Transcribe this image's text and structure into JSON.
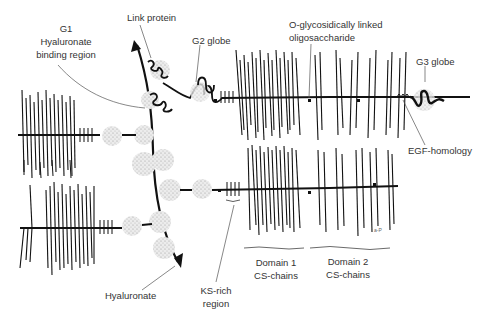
{
  "diagram": {
    "labels": {
      "g1_line1": "G1",
      "g1_line2": "Hyaluronate",
      "g1_line3": "binding region",
      "link_protein": "Link protein",
      "g2_globe": "G2 globe",
      "o_glyco_line1": "O-glycosidically linked",
      "o_glyco_line2": "oligosaccharide",
      "g3_globe": "G3 globe",
      "egf_homology": "EGF-homology",
      "domain1_line1": "Domain 1",
      "domain1_line2": "CS-chains",
      "domain2_line1": "Domain 2",
      "domain2_line2": "CS-chains",
      "ks_line1": "KS-rich",
      "ks_line2": "region",
      "hyaluronate": "Hyaluronate",
      "signature": "a-P"
    },
    "colors": {
      "line": "#111111",
      "globe": "#c8c8c8",
      "text": "#333333",
      "leader": "#555555"
    }
  }
}
